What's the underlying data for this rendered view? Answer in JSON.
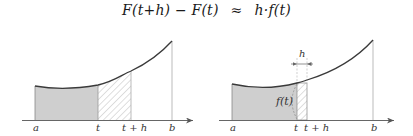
{
  "formula": {
    "lhs": "F(t+h) − F(t)",
    "relation": "≈",
    "rhs": "h·f(t)"
  },
  "left_panel": {
    "labels": {
      "a": "a",
      "t": "t",
      "t_plus_h": "t + h",
      "b": "b"
    },
    "regions": {
      "area_a_to_t": "shaded grey",
      "area_t_to_t_plus_h": "hatched"
    }
  },
  "right_panel": {
    "labels": {
      "a": "a",
      "t": "t",
      "t_plus_h": "t + h",
      "b": "b",
      "h": "h",
      "f_t": "f(t)"
    },
    "regions": {
      "area_a_to_t": "shaded grey",
      "rectangle_t_to_t_plus_h": "hatched rectangle of height f(t)"
    }
  },
  "colors": {
    "shade": "#cfcfcf",
    "curve": "#3a3a3a",
    "axis": "#555555",
    "hatch": "#b5b5b5",
    "guide": "#bdbdbd"
  }
}
